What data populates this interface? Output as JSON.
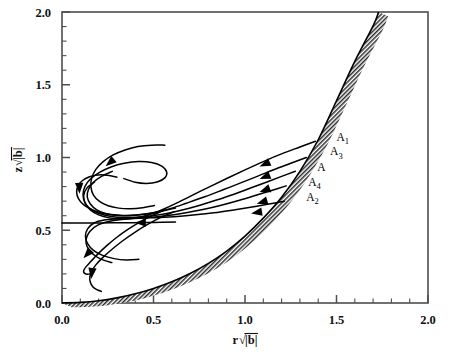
{
  "figure": {
    "kind": "phase-portrait",
    "background_color": "#ffffff",
    "line_color": "#000000",
    "axis_color": "#4d4d4d"
  },
  "chart_data": {
    "type": "line",
    "title": "",
    "subtitle": "",
    "xlabel": "r√|b|",
    "ylabel": "z√|b|",
    "xlabel_parts": {
      "var": "r",
      "radical": "√",
      "arg": "|b|"
    },
    "ylabel_parts": {
      "var": "z",
      "radical": "√",
      "arg": "|b|"
    },
    "xlim": [
      0.0,
      2.0
    ],
    "ylim": [
      0.0,
      2.0
    ],
    "grid": false,
    "legend": "none",
    "xticks": [
      0.0,
      0.5,
      1.0,
      1.5,
      2.0
    ],
    "yticks": [
      0.0,
      0.5,
      1.0,
      1.5,
      2.0
    ],
    "xticklabels": [
      "0.0",
      "0.5",
      "1.0",
      "1.5",
      "2.0"
    ],
    "yticklabels": [
      "0.0",
      "0.5",
      "1.0",
      "1.5",
      "2.0"
    ],
    "minor_ticks_per_interval": 4,
    "annotations": [
      {
        "text": "A",
        "sub": "1",
        "x": 1.5,
        "y": 1.115
      },
      {
        "text": "A",
        "sub": "3",
        "x": 1.465,
        "y": 1.015
      },
      {
        "text": "A",
        "sub": "",
        "x": 1.395,
        "y": 0.905
      },
      {
        "text": "A",
        "sub": "4",
        "x": 1.345,
        "y": 0.805
      },
      {
        "text": "A",
        "sub": "2",
        "x": 1.335,
        "y": 0.7
      }
    ],
    "series": [
      {
        "name": "boundary-envelope",
        "style": "hatched-band",
        "description": "shaded boundary curve rising from origin to top of frame",
        "points": [
          [
            0.0,
            0.0
          ],
          [
            0.1,
            0.004
          ],
          [
            0.2,
            0.015
          ],
          [
            0.3,
            0.035
          ],
          [
            0.4,
            0.063
          ],
          [
            0.5,
            0.1
          ],
          [
            0.6,
            0.146
          ],
          [
            0.7,
            0.203
          ],
          [
            0.8,
            0.272
          ],
          [
            0.9,
            0.357
          ],
          [
            1.0,
            0.46
          ],
          [
            1.1,
            0.583
          ],
          [
            1.2,
            0.727
          ],
          [
            1.3,
            0.905
          ],
          [
            1.4,
            1.122
          ],
          [
            1.5,
            1.39
          ],
          [
            1.6,
            1.66
          ],
          [
            1.7,
            1.905
          ],
          [
            1.73,
            2.0
          ]
        ]
      },
      {
        "name": "A1",
        "style": "trajectory",
        "arrow_at": [
          1.1,
          0.95
        ],
        "points": [
          [
            1.385,
            1.112
          ],
          [
            1.3,
            1.072
          ],
          [
            1.2,
            1.025
          ],
          [
            1.1,
            0.972
          ],
          [
            1.0,
            0.915
          ],
          [
            0.9,
            0.856
          ],
          [
            0.8,
            0.795
          ],
          [
            0.7,
            0.733
          ],
          [
            0.62,
            0.683
          ],
          [
            0.56,
            0.648
          ],
          [
            0.5,
            0.617
          ],
          [
            0.44,
            0.594
          ],
          [
            0.38,
            0.58
          ],
          [
            0.32,
            0.577
          ],
          [
            0.26,
            0.585
          ],
          [
            0.2,
            0.606
          ],
          [
            0.155,
            0.64
          ],
          [
            0.125,
            0.69
          ],
          [
            0.115,
            0.745
          ],
          [
            0.125,
            0.8
          ],
          [
            0.155,
            0.852
          ],
          [
            0.205,
            0.898
          ],
          [
            0.268,
            0.935
          ],
          [
            0.34,
            0.96
          ],
          [
            0.418,
            0.972
          ],
          [
            0.49,
            0.965
          ],
          [
            0.545,
            0.94
          ],
          [
            0.572,
            0.9
          ],
          [
            0.562,
            0.86
          ],
          [
            0.52,
            0.832
          ],
          [
            0.462,
            0.822
          ],
          [
            0.4,
            0.83
          ],
          [
            0.338,
            0.855
          ]
        ]
      },
      {
        "name": "A3",
        "style": "trajectory",
        "arrow_at": [
          1.1,
          0.862
        ],
        "points": [
          [
            1.335,
            1.0
          ],
          [
            1.25,
            0.96
          ],
          [
            1.16,
            0.918
          ],
          [
            1.07,
            0.872
          ],
          [
            0.98,
            0.827
          ],
          [
            0.88,
            0.778
          ],
          [
            0.78,
            0.73
          ],
          [
            0.68,
            0.686
          ],
          [
            0.6,
            0.652
          ],
          [
            0.52,
            0.625
          ],
          [
            0.44,
            0.608
          ],
          [
            0.37,
            0.6
          ],
          [
            0.3,
            0.602
          ],
          [
            0.24,
            0.614
          ],
          [
            0.19,
            0.64
          ],
          [
            0.155,
            0.68
          ],
          [
            0.138,
            0.73
          ],
          [
            0.145,
            0.782
          ],
          [
            0.172,
            0.83
          ],
          [
            0.218,
            0.872
          ],
          [
            0.275,
            0.905
          ]
        ]
      },
      {
        "name": "A",
        "style": "trajectory",
        "arrow_at": [
          1.1,
          0.772
        ],
        "points": [
          [
            1.275,
            0.905
          ],
          [
            1.2,
            0.87
          ],
          [
            1.12,
            0.832
          ],
          [
            1.03,
            0.79
          ],
          [
            0.94,
            0.748
          ],
          [
            0.84,
            0.706
          ],
          [
            0.74,
            0.667
          ],
          [
            0.64,
            0.634
          ],
          [
            0.55,
            0.61
          ],
          [
            0.46,
            0.594
          ],
          [
            0.38,
            0.588
          ],
          [
            0.3,
            0.59
          ],
          [
            0.23,
            0.605
          ],
          [
            0.17,
            0.635
          ],
          [
            0.13,
            0.68
          ],
          [
            0.118,
            0.735
          ],
          [
            0.135,
            0.788
          ],
          [
            0.178,
            0.832
          ]
        ]
      },
      {
        "name": "A4",
        "style": "trajectory",
        "arrow_at": [
          1.085,
          0.69
        ],
        "points": [
          [
            1.225,
            0.805
          ],
          [
            1.15,
            0.775
          ],
          [
            1.06,
            0.74
          ],
          [
            0.97,
            0.706
          ],
          [
            0.87,
            0.672
          ],
          [
            0.77,
            0.642
          ],
          [
            0.67,
            0.618
          ],
          [
            0.57,
            0.6
          ],
          [
            0.47,
            0.588
          ],
          [
            0.38,
            0.582
          ],
          [
            0.3,
            0.578
          ],
          [
            0.23,
            0.57
          ],
          [
            0.175,
            0.55
          ],
          [
            0.14,
            0.51
          ],
          [
            0.128,
            0.46
          ],
          [
            0.14,
            0.408
          ],
          [
            0.172,
            0.362
          ],
          [
            0.222,
            0.327
          ],
          [
            0.285,
            0.305
          ],
          [
            0.352,
            0.296
          ],
          [
            0.42,
            0.3
          ]
        ]
      },
      {
        "name": "A2",
        "style": "trajectory",
        "arrow_at": [
          1.055,
          0.62
        ],
        "points": [
          [
            1.215,
            0.7
          ],
          [
            1.13,
            0.68
          ],
          [
            1.03,
            0.658
          ],
          [
            0.93,
            0.638
          ],
          [
            0.83,
            0.62
          ],
          [
            0.73,
            0.606
          ],
          [
            0.63,
            0.595
          ],
          [
            0.53,
            0.588
          ],
          [
            0.43,
            0.583
          ],
          [
            0.34,
            0.576
          ],
          [
            0.26,
            0.562
          ],
          [
            0.195,
            0.535
          ],
          [
            0.152,
            0.492
          ],
          [
            0.132,
            0.44
          ],
          [
            0.137,
            0.388
          ],
          [
            0.165,
            0.34
          ],
          [
            0.212,
            0.302
          ],
          [
            0.272,
            0.278
          ]
        ]
      },
      {
        "name": "horizontal-inflow",
        "style": "trajectory",
        "arrow_at": [
          0.42,
          0.552
        ],
        "points": [
          [
            0.62,
            0.556
          ],
          [
            0.5,
            0.554
          ],
          [
            0.38,
            0.552
          ],
          [
            0.26,
            0.551
          ],
          [
            0.14,
            0.55
          ],
          [
            0.06,
            0.55
          ],
          [
            0.0,
            0.55
          ]
        ]
      },
      {
        "name": "upper-spiral-outer",
        "style": "trajectory",
        "arrow_at": [
          0.255,
          0.958
        ],
        "points": [
          [
            0.562,
            1.085
          ],
          [
            0.49,
            1.085
          ],
          [
            0.415,
            1.075
          ],
          [
            0.345,
            1.052
          ],
          [
            0.28,
            1.018
          ],
          [
            0.225,
            0.972
          ],
          [
            0.185,
            0.918
          ],
          [
            0.162,
            0.858
          ],
          [
            0.158,
            0.798
          ],
          [
            0.172,
            0.742
          ],
          [
            0.205,
            0.698
          ],
          [
            0.252,
            0.668
          ],
          [
            0.31,
            0.652
          ],
          [
            0.375,
            0.648
          ],
          [
            0.44,
            0.655
          ],
          [
            0.505,
            0.67
          ]
        ]
      },
      {
        "name": "upper-spiral-inner",
        "style": "trajectory",
        "arrow_at": [
          0.095,
          0.778
        ],
        "points": [
          [
            0.3,
            0.865
          ],
          [
            0.248,
            0.878
          ],
          [
            0.196,
            0.88
          ],
          [
            0.15,
            0.868
          ],
          [
            0.112,
            0.842
          ],
          [
            0.088,
            0.805
          ],
          [
            0.08,
            0.762
          ],
          [
            0.09,
            0.718
          ],
          [
            0.116,
            0.678
          ],
          [
            0.156,
            0.646
          ],
          [
            0.208,
            0.622
          ],
          [
            0.268,
            0.608
          ],
          [
            0.335,
            0.602
          ],
          [
            0.405,
            0.605
          ],
          [
            0.478,
            0.615
          ],
          [
            0.55,
            0.632
          ],
          [
            0.62,
            0.652
          ]
        ]
      },
      {
        "name": "lower-spiral-outer",
        "style": "trajectory",
        "arrow_at": [
          0.132,
          0.328
        ],
        "points": [
          [
            0.56,
            0.64
          ],
          [
            0.492,
            0.6
          ],
          [
            0.425,
            0.556
          ],
          [
            0.36,
            0.506
          ],
          [
            0.3,
            0.452
          ],
          [
            0.248,
            0.398
          ],
          [
            0.205,
            0.348
          ],
          [
            0.172,
            0.305
          ],
          [
            0.148,
            0.272
          ],
          [
            0.132,
            0.25
          ],
          [
            0.122,
            0.232
          ],
          [
            0.118,
            0.218
          ],
          [
            0.122,
            0.205
          ],
          [
            0.135,
            0.198
          ],
          [
            0.152,
            0.2
          ],
          [
            0.172,
            0.212
          ]
        ]
      },
      {
        "name": "lower-spiral-inner",
        "style": "trajectory",
        "arrow_at": [
          0.162,
          0.192
        ],
        "points": [
          [
            0.612,
            0.628
          ],
          [
            0.54,
            0.588
          ],
          [
            0.468,
            0.54
          ],
          [
            0.398,
            0.486
          ],
          [
            0.332,
            0.428
          ],
          [
            0.272,
            0.368
          ],
          [
            0.222,
            0.312
          ],
          [
            0.185,
            0.262
          ],
          [
            0.162,
            0.218
          ],
          [
            0.152,
            0.178
          ],
          [
            0.155,
            0.142
          ],
          [
            0.168,
            0.112
          ],
          [
            0.19,
            0.092
          ],
          [
            0.215,
            0.08
          ]
        ]
      }
    ]
  }
}
